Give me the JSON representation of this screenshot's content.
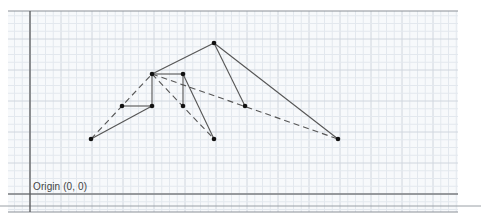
{
  "diagram": {
    "type": "graph-on-grid",
    "origin_label": "Origin (0, 0)",
    "canvas": {
      "width": 481,
      "height": 221
    },
    "frame": {
      "left": 8,
      "right": 458,
      "top": 11,
      "bottom": 212
    },
    "extra_line": {
      "x1": 0,
      "x2": 481,
      "y": 206
    },
    "grid": {
      "origin_px": {
        "x": 30,
        "y": 194
      },
      "minor_spacing_px": 7.75,
      "major_every": 4,
      "minor_color": "#e3e8ee",
      "major_color": "#d0d6de",
      "axis_color": "#555555",
      "frame_color": "#8a8f96"
    },
    "point_color": "#111111",
    "edge_color": "#555555",
    "points": [
      {
        "id": "A",
        "x": 91,
        "y": 139
      },
      {
        "id": "B",
        "x": 122,
        "y": 106
      },
      {
        "id": "C",
        "x": 152,
        "y": 106
      },
      {
        "id": "D",
        "x": 152,
        "y": 74
      },
      {
        "id": "E",
        "x": 183,
        "y": 74
      },
      {
        "id": "F",
        "x": 183,
        "y": 106
      },
      {
        "id": "G",
        "x": 214,
        "y": 43
      },
      {
        "id": "H",
        "x": 245,
        "y": 106
      },
      {
        "id": "I",
        "x": 214,
        "y": 139
      },
      {
        "id": "J",
        "x": 338,
        "y": 139
      }
    ],
    "edges": [
      {
        "from": "A",
        "to": "C",
        "style": "solid"
      },
      {
        "from": "B",
        "to": "C",
        "style": "solid"
      },
      {
        "from": "C",
        "to": "D",
        "style": "solid"
      },
      {
        "from": "D",
        "to": "E",
        "style": "solid"
      },
      {
        "from": "E",
        "to": "F",
        "style": "solid"
      },
      {
        "from": "E",
        "to": "I",
        "style": "solid"
      },
      {
        "from": "D",
        "to": "G",
        "style": "solid"
      },
      {
        "from": "G",
        "to": "H",
        "style": "solid"
      },
      {
        "from": "G",
        "to": "J",
        "style": "solid"
      },
      {
        "from": "A",
        "to": "D",
        "style": "dashed"
      },
      {
        "from": "D",
        "to": "I",
        "style": "dashed"
      },
      {
        "from": "D",
        "to": "J",
        "style": "dashed"
      }
    ]
  }
}
